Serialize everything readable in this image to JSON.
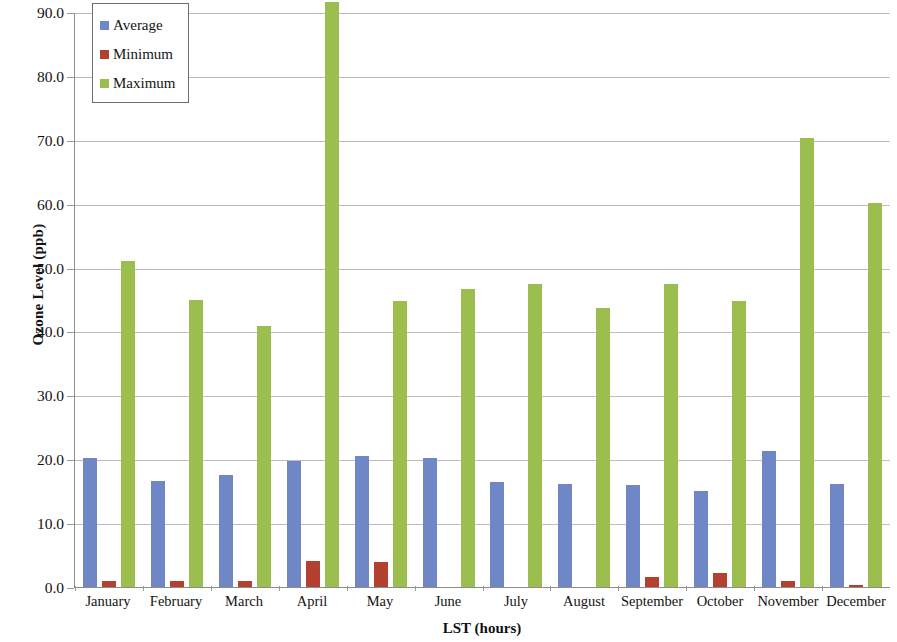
{
  "chart_data": {
    "type": "bar",
    "title": "",
    "xlabel": "LST (hours)",
    "ylabel": "Ozone Level (ppb)",
    "ylim": [
      0.0,
      90.0
    ],
    "ytick_step": 10.0,
    "ytick_labels": [
      "90.0",
      "80.0",
      "70.0",
      "60.0",
      "50.0",
      "40.0",
      "30.0",
      "20.0",
      "10.0",
      "0.0"
    ],
    "ytick_values": [
      90.0,
      80.0,
      70.0,
      60.0,
      50.0,
      40.0,
      30.0,
      20.0,
      10.0,
      0.0
    ],
    "grid": true,
    "legend_position": "top-left",
    "categories": [
      "January",
      "February",
      "March",
      "April",
      "May",
      "June",
      "July",
      "August",
      "September",
      "October",
      "November",
      "December"
    ],
    "series": [
      {
        "name": "Average",
        "color": "#6f86c7",
        "values": [
          20.2,
          16.6,
          17.6,
          19.7,
          20.5,
          20.2,
          16.5,
          16.1,
          15.9,
          15.0,
          21.3,
          16.1
        ]
      },
      {
        "name": "Minimum",
        "color": "#b4412f",
        "values": [
          1.0,
          1.0,
          0.9,
          4.0,
          3.9,
          0.0,
          0.0,
          0.0,
          1.5,
          2.2,
          0.9,
          0.3
        ]
      },
      {
        "name": "Maximum",
        "color": "#9cbe4f",
        "values": [
          51.0,
          44.9,
          40.9,
          91.5,
          44.8,
          46.6,
          47.5,
          43.7,
          47.4,
          44.8,
          70.3,
          60.1
        ]
      }
    ]
  },
  "legend": {
    "items": [
      {
        "label": "Average",
        "color": "#6f86c7"
      },
      {
        "label": "Minimum",
        "color": "#b4412f"
      },
      {
        "label": "Maximum",
        "color": "#9cbe4f"
      }
    ]
  }
}
